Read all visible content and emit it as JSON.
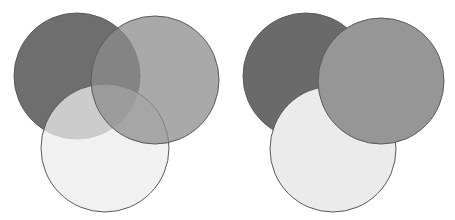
{
  "panels": [
    {
      "name": "translucent",
      "circles": [
        {
          "name": "dark-circle",
          "cx": 77,
          "cy": 76,
          "r": 63,
          "fill": "#5e5e5e",
          "opacity": 0.9
        },
        {
          "name": "light-circle",
          "cx": 105,
          "cy": 148,
          "r": 64,
          "fill": "#ececec",
          "opacity": 0.75
        },
        {
          "name": "medium-circle",
          "cx": 155,
          "cy": 80,
          "r": 64,
          "fill": "#8c8c8c",
          "opacity": 0.75
        }
      ]
    },
    {
      "name": "opaque",
      "circles": [
        {
          "name": "dark-circle",
          "cx": 306,
          "cy": 76,
          "r": 63,
          "fill": "#6a6a6a",
          "opacity": 1
        },
        {
          "name": "light-circle",
          "cx": 333,
          "cy": 149,
          "r": 63,
          "fill": "#ebebeb",
          "opacity": 1
        },
        {
          "name": "medium-circle",
          "cx": 381,
          "cy": 81,
          "r": 63,
          "fill": "#969696",
          "opacity": 1
        }
      ]
    }
  ],
  "stroke": "#5a5a5a"
}
